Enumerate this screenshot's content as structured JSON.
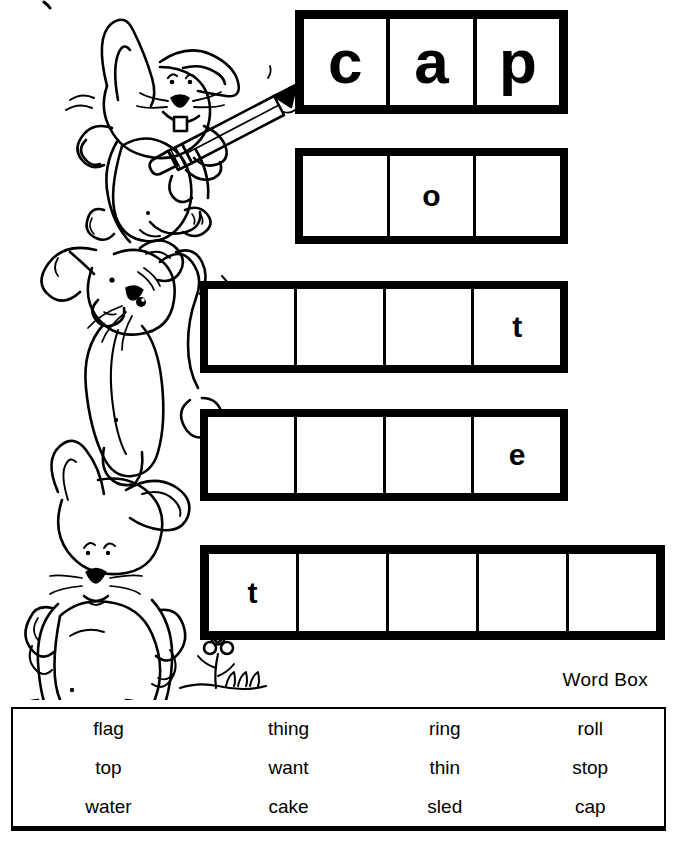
{
  "worksheet": {
    "title": "Word Box Spelling Worksheet",
    "illustration": "three-stacked-rabbits-with-pencil-and-flower"
  },
  "puzzle_rows": [
    {
      "id": "row-1",
      "cells": 3,
      "letters": [
        "c",
        "a",
        "p"
      ]
    },
    {
      "id": "row-2",
      "cells": 3,
      "letters": [
        "",
        "o",
        ""
      ]
    },
    {
      "id": "row-3",
      "cells": 4,
      "letters": [
        "",
        "",
        "",
        "t"
      ]
    },
    {
      "id": "row-4",
      "cells": 4,
      "letters": [
        "",
        "",
        "",
        "e"
      ]
    },
    {
      "id": "row-5",
      "cells": 5,
      "letters": [
        "t",
        "",
        "",
        "",
        ""
      ]
    }
  ],
  "word_box": {
    "label": "Word Box",
    "rows": [
      [
        "flag",
        "thing",
        "ring",
        "roll"
      ],
      [
        "top",
        "want",
        "thin",
        "stop"
      ],
      [
        "water",
        "cake",
        "sled",
        "cap"
      ]
    ]
  }
}
